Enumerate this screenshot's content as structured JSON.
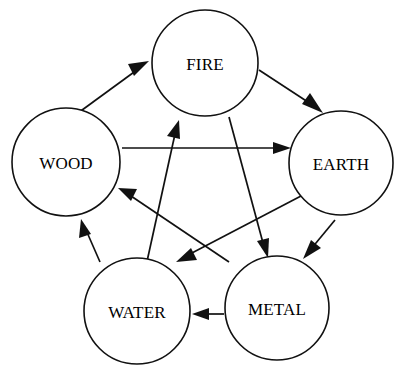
{
  "diagram": {
    "background_color": "#ffffff",
    "line_color": "#111111",
    "nodes": [
      {
        "id": "fire",
        "label": "FIRE",
        "cx": 205,
        "cy": 63,
        "r": 53
      },
      {
        "id": "earth",
        "label": "EARTH",
        "cx": 341,
        "cy": 163,
        "r": 52
      },
      {
        "id": "metal",
        "label": "METAL",
        "cx": 277,
        "cy": 308,
        "r": 52
      },
      {
        "id": "water",
        "label": "WATER",
        "cx": 137,
        "cy": 311,
        "r": 53
      },
      {
        "id": "wood",
        "label": "WOOD",
        "cx": 66,
        "cy": 162,
        "r": 54
      }
    ],
    "edges": [
      {
        "id": "wood-to-fire",
        "from": "WOOD",
        "to": "FIRE",
        "cycle": "generating"
      },
      {
        "id": "fire-to-earth",
        "from": "FIRE",
        "to": "EARTH",
        "cycle": "generating"
      },
      {
        "id": "earth-to-metal",
        "from": "EARTH",
        "to": "METAL",
        "cycle": "generating"
      },
      {
        "id": "metal-to-water",
        "from": "METAL",
        "to": "WATER",
        "cycle": "generating"
      },
      {
        "id": "water-to-wood",
        "from": "WATER",
        "to": "WOOD",
        "cycle": "generating"
      },
      {
        "id": "wood-to-earth",
        "from": "WOOD",
        "to": "EARTH",
        "cycle": "overcoming"
      },
      {
        "id": "earth-to-water",
        "from": "EARTH",
        "to": "WATER",
        "cycle": "overcoming"
      },
      {
        "id": "water-to-fire",
        "from": "WATER",
        "to": "FIRE",
        "cycle": "overcoming"
      },
      {
        "id": "fire-to-metal",
        "from": "FIRE",
        "to": "METAL",
        "cycle": "overcoming"
      },
      {
        "id": "metal-to-wood",
        "from": "METAL",
        "to": "WOOD",
        "cycle": "overcoming"
      }
    ]
  },
  "labels": {
    "fire": "FIRE",
    "earth": "EARTH",
    "metal": "METAL",
    "water": "WATER",
    "wood": "WOOD"
  }
}
